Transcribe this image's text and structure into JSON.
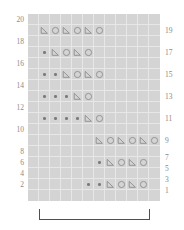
{
  "chart_data": {
    "type": "table",
    "title": "",
    "columns": 12,
    "rows": 17,
    "symbol_legend": {
      "purl": "dot",
      "decrease": "left-leaning-triangle",
      "yarnover": "circle",
      "blank": "empty"
    },
    "colors": {
      "grid_background": "#d4d4d4",
      "grid_line": "#e7e7e7",
      "symbol_stroke": "#8d8d8d",
      "dot_fill": "#7b7b7b",
      "label_text": "#8a8a8a",
      "bracket": "#4f4f4f"
    },
    "row_labels_left": [
      "20",
      "18",
      "16",
      "14",
      "12",
      "10",
      "8",
      "6",
      "4",
      "2"
    ],
    "row_labels_right": [
      "19",
      "17",
      "15",
      "13",
      "11",
      "9",
      "7",
      "5",
      "3",
      "1"
    ],
    "grid": [
      [
        "blank",
        "blank",
        "blank",
        "blank",
        "blank",
        "blank",
        "blank",
        "blank",
        "blank",
        "blank",
        "blank",
        "blank"
      ],
      [
        "blank",
        "decrease",
        "yarnover",
        "decrease",
        "yarnover",
        "decrease",
        "yarnover",
        "blank",
        "blank",
        "blank",
        "blank",
        "blank"
      ],
      [
        "blank",
        "blank",
        "blank",
        "blank",
        "blank",
        "blank",
        "blank",
        "blank",
        "blank",
        "blank",
        "blank",
        "blank"
      ],
      [
        "blank",
        "purl",
        "decrease",
        "yarnover",
        "decrease",
        "yarnover",
        "blank",
        "blank",
        "blank",
        "blank",
        "blank",
        "blank"
      ],
      [
        "blank",
        "blank",
        "blank",
        "blank",
        "blank",
        "blank",
        "blank",
        "blank",
        "blank",
        "blank",
        "blank",
        "blank"
      ],
      [
        "blank",
        "purl",
        "purl",
        "decrease",
        "yarnover",
        "decrease",
        "yarnover",
        "blank",
        "blank",
        "blank",
        "blank",
        "blank"
      ],
      [
        "blank",
        "blank",
        "blank",
        "blank",
        "blank",
        "blank",
        "blank",
        "blank",
        "blank",
        "blank",
        "blank",
        "blank"
      ],
      [
        "blank",
        "purl",
        "purl",
        "purl",
        "decrease",
        "yarnover",
        "blank",
        "blank",
        "blank",
        "blank",
        "blank",
        "blank"
      ],
      [
        "blank",
        "blank",
        "blank",
        "blank",
        "blank",
        "blank",
        "blank",
        "blank",
        "blank",
        "blank",
        "blank",
        "blank"
      ],
      [
        "blank",
        "purl",
        "purl",
        "purl",
        "purl",
        "decrease",
        "yarnover",
        "blank",
        "blank",
        "blank",
        "blank",
        "blank"
      ],
      [
        "blank",
        "blank",
        "blank",
        "blank",
        "blank",
        "blank",
        "blank",
        "blank",
        "blank",
        "blank",
        "blank",
        "blank"
      ],
      [
        "blank",
        "blank",
        "blank",
        "blank",
        "blank",
        "blank",
        "decrease",
        "yarnover",
        "decrease",
        "yarnover",
        "decrease",
        "yarnover"
      ],
      [
        "blank",
        "blank",
        "blank",
        "blank",
        "blank",
        "blank",
        "blank",
        "blank",
        "blank",
        "blank",
        "blank",
        "blank"
      ],
      [
        "blank",
        "blank",
        "blank",
        "blank",
        "blank",
        "blank",
        "purl",
        "decrease",
        "yarnover",
        "decrease",
        "yarnover",
        "blank"
      ],
      [
        "blank",
        "blank",
        "blank",
        "blank",
        "blank",
        "blank",
        "blank",
        "blank",
        "blank",
        "blank",
        "blank",
        "blank"
      ],
      [
        "blank",
        "blank",
        "blank",
        "blank",
        "blank",
        "purl",
        "purl",
        "decrease",
        "yarnover",
        "decrease",
        "yarnover",
        "blank"
      ],
      [
        "blank",
        "blank",
        "blank",
        "blank",
        "blank",
        "blank",
        "blank",
        "blank",
        "blank",
        "blank",
        "blank",
        "blank"
      ]
    ],
    "grid_extra_rows_note": "rows listed top to bottom; odd pattern rows carry symbols",
    "repeat_bracket": {
      "label": "",
      "start_column": 1,
      "end_column": 11
    }
  }
}
